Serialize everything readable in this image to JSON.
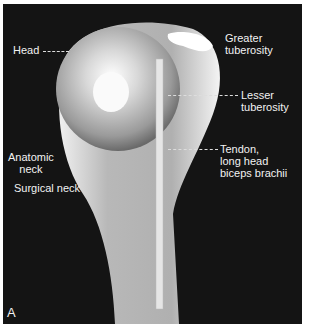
{
  "figure": {
    "panel_letter": "A",
    "labels": {
      "head": "Head",
      "greater_tuberosity": [
        "Greater",
        "tuberosity"
      ],
      "lesser_tuberosity": [
        "Lesser",
        "tuberosity"
      ],
      "anatomic_neck": [
        "Anatomic",
        "neck"
      ],
      "tendon": [
        "Tendon,",
        "long head",
        "biceps brachii"
      ],
      "surgical_neck": "Surgical neck"
    },
    "colors": {
      "background": "#141414",
      "bone": "#e8e8e8",
      "label": "#f2f2f2"
    }
  }
}
